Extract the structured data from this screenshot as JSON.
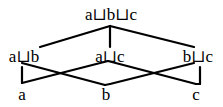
{
  "diagram": {
    "type": "hasse-lattice",
    "nodes": [
      {
        "id": "abc",
        "label": "a⊔b⊔c",
        "x": 111,
        "y": 6
      },
      {
        "id": "ab",
        "label": "a⊔b",
        "x": 24,
        "y": 48
      },
      {
        "id": "ac",
        "label": "a⊔c",
        "x": 110,
        "y": 48
      },
      {
        "id": "bc",
        "label": "b⊔c",
        "x": 198,
        "y": 48
      },
      {
        "id": "a",
        "label": "a",
        "x": 22,
        "y": 86
      },
      {
        "id": "b",
        "label": "b",
        "x": 106,
        "y": 86
      },
      {
        "id": "c",
        "label": "c",
        "x": 196,
        "y": 86
      }
    ],
    "edges": [
      [
        "abc",
        "ab"
      ],
      [
        "abc",
        "ac"
      ],
      [
        "abc",
        "bc"
      ],
      [
        "ab",
        "a"
      ],
      [
        "ab",
        "b"
      ],
      [
        "ac",
        "a"
      ],
      [
        "ac",
        "c"
      ],
      [
        "bc",
        "b"
      ],
      [
        "bc",
        "c"
      ]
    ],
    "line_color": "#000000"
  }
}
